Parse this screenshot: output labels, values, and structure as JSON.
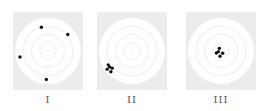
{
  "figure": {
    "background_color": "#ececec",
    "ring_color": "#ffffff",
    "dot_color": "#111111",
    "panels": [
      {
        "label": "I",
        "caption_meaning": "spread out, not clustered",
        "hits": [
          [
            -0.2,
            -0.72
          ],
          [
            0.6,
            -0.5
          ],
          [
            -0.85,
            0.18
          ],
          [
            -0.05,
            0.86
          ]
        ]
      },
      {
        "label": "II",
        "caption_meaning": "clustered but off-center",
        "hits": [
          [
            -0.72,
            0.42
          ],
          [
            -0.6,
            0.52
          ],
          [
            -0.75,
            0.55
          ],
          [
            -0.64,
            0.63
          ],
          [
            -0.68,
            0.48
          ]
        ]
      },
      {
        "label": "III",
        "caption_meaning": "clustered at center",
        "hits": [
          [
            -0.05,
            -0.08
          ],
          [
            -0.14,
            0.06
          ],
          [
            0.05,
            0.07
          ],
          [
            -0.03,
            0.16
          ],
          [
            -0.08,
            0.02
          ]
        ]
      }
    ]
  }
}
